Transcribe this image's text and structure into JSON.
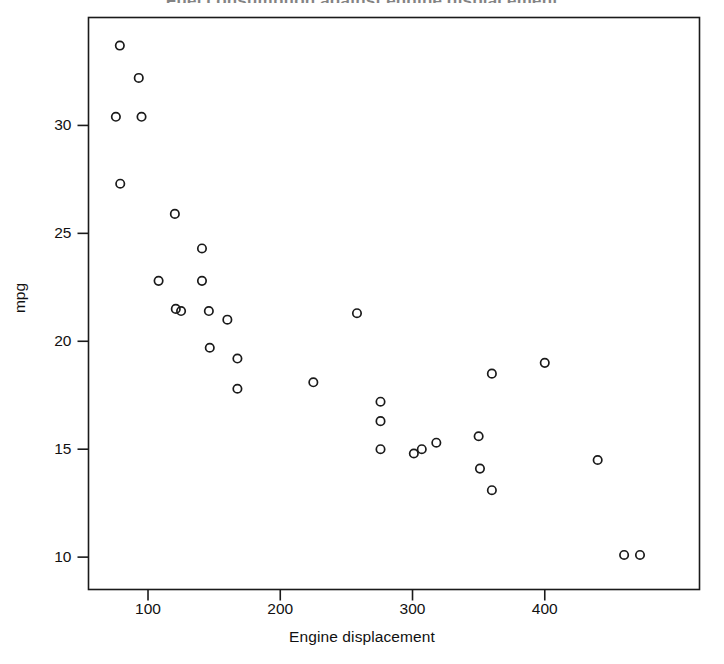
{
  "chart_data": {
    "type": "scatter",
    "title": "Fuel consumption against engine displacement",
    "xlabel": "Engine displacement",
    "ylabel": "mpg",
    "xlim": [
      55,
      517
    ],
    "ylim": [
      8.5,
      35.0
    ],
    "xticks": [
      100,
      200,
      300,
      400
    ],
    "xtick_labels": [
      "100",
      "200",
      "300",
      "400"
    ],
    "yticks": [
      10,
      15,
      20,
      25,
      30
    ],
    "ytick_labels": [
      "10",
      "15",
      "20",
      "25",
      "30"
    ],
    "grid": false,
    "legend": null,
    "marker": "open-circle",
    "marker_color": "#1a1a1a",
    "marker_size": 5,
    "n_points": 32,
    "points": [
      {
        "x": 78.7,
        "y": 33.7
      },
      {
        "x": 93.0,
        "y": 32.2
      },
      {
        "x": 75.7,
        "y": 30.4
      },
      {
        "x": 95.1,
        "y": 30.4
      },
      {
        "x": 79.0,
        "y": 27.3
      },
      {
        "x": 120.3,
        "y": 25.9
      },
      {
        "x": 140.8,
        "y": 24.3
      },
      {
        "x": 108.0,
        "y": 22.8
      },
      {
        "x": 140.8,
        "y": 22.8
      },
      {
        "x": 121.0,
        "y": 21.5
      },
      {
        "x": 125.0,
        "y": 21.4
      },
      {
        "x": 160.0,
        "y": 21.0
      },
      {
        "x": 258.0,
        "y": 21.3
      },
      {
        "x": 146.7,
        "y": 19.7
      },
      {
        "x": 167.6,
        "y": 19.2
      },
      {
        "x": 167.6,
        "y": 17.8
      },
      {
        "x": 225.0,
        "y": 18.1
      },
      {
        "x": 275.8,
        "y": 17.2
      },
      {
        "x": 275.8,
        "y": 16.3
      },
      {
        "x": 275.8,
        "y": 15.0
      },
      {
        "x": 301.0,
        "y": 14.8
      },
      {
        "x": 307.0,
        "y": 15.0
      },
      {
        "x": 318.0,
        "y": 15.3
      },
      {
        "x": 350.0,
        "y": 15.6
      },
      {
        "x": 351.0,
        "y": 14.1
      },
      {
        "x": 360.0,
        "y": 18.5
      },
      {
        "x": 360.0,
        "y": 13.1
      },
      {
        "x": 400.0,
        "y": 19.0
      },
      {
        "x": 440.0,
        "y": 14.5
      },
      {
        "x": 460.0,
        "y": 10.1
      },
      {
        "x": 472.0,
        "y": 10.1
      },
      {
        "x": 146.0,
        "y": 21.4
      }
    ]
  }
}
